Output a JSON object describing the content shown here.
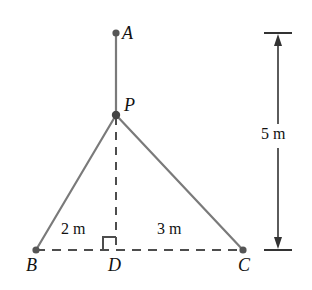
{
  "figure": {
    "type": "geometry-diagram",
    "colors": {
      "line": "#7a7a7a",
      "dash": "#4d4d4d",
      "text": "#111111",
      "point": "#555555",
      "background": "#ffffff"
    },
    "points": [
      {
        "id": "A",
        "label": "A",
        "x": 116,
        "y": 33
      },
      {
        "id": "P",
        "label": "P",
        "x": 116,
        "y": 115
      },
      {
        "id": "B",
        "label": "B",
        "x": 36,
        "y": 250
      },
      {
        "id": "D",
        "label": "D",
        "x": 116,
        "y": 250
      },
      {
        "id": "C",
        "label": "C",
        "x": 243,
        "y": 250
      }
    ],
    "segments": [
      {
        "id": "A-P",
        "from": "A",
        "to": "P",
        "style": "solid"
      },
      {
        "id": "P-B",
        "from": "P",
        "to": "B",
        "style": "solid"
      },
      {
        "id": "P-C",
        "from": "P",
        "to": "C",
        "style": "solid"
      },
      {
        "id": "P-D",
        "from": "P",
        "to": "D",
        "style": "dashed"
      },
      {
        "id": "B-C",
        "from": "B",
        "to": "C",
        "style": "dashed"
      }
    ],
    "right_angle": {
      "at": "D",
      "opens_toward": "B",
      "size": 13
    },
    "measurements": [
      {
        "id": "BD",
        "value": "2 m",
        "between": [
          "B",
          "D"
        ]
      },
      {
        "id": "DC",
        "value": "3 m",
        "between": [
          "D",
          "C"
        ]
      },
      {
        "id": "AD",
        "value": "5 m",
        "between": [
          "A",
          "D"
        ],
        "style": "double-arrow-dimension"
      }
    ],
    "dimension_line": {
      "x": 278,
      "top_y": 33,
      "bottom_y": 250,
      "tick_half_width": 14
    },
    "labels": {
      "A": "A",
      "P": "P",
      "B": "B",
      "D": "D",
      "C": "C",
      "BD": "2 m",
      "DC": "3 m",
      "height": "5 m"
    }
  }
}
